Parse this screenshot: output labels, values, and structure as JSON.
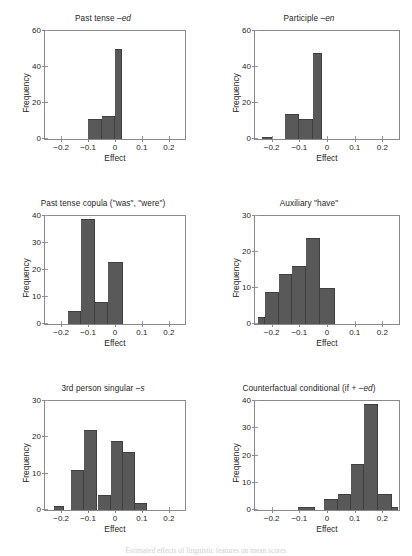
{
  "figure": {
    "background": "#ffffff",
    "bar_color": "#595959",
    "axis_color": "#8a8a8a",
    "caption": "Estimated effects of linguistic features on mean scores"
  },
  "chart_data": [
    {
      "type": "bar",
      "title_prefix": "Past tense –",
      "title_italic": "ed",
      "title": "Past tense –ed",
      "xlabel": "Effect",
      "ylabel": "Frequency",
      "xlim": [
        -0.26,
        0.26
      ],
      "ylim": [
        0,
        60
      ],
      "yticks": [
        0,
        20,
        40,
        60
      ],
      "xticks": [
        -0.2,
        -0.1,
        0,
        0.1,
        0.2
      ],
      "xticklabels": [
        "−0.2",
        "−0.1",
        "0",
        "0.1",
        "0.2"
      ],
      "grid": false,
      "bin_width": 0.05,
      "bins": [
        {
          "x0": -0.1,
          "x1": -0.05,
          "value": 11
        },
        {
          "x0": -0.05,
          "x1": 0.0,
          "value": 13
        },
        {
          "x0": 0.0,
          "x1": 0.025,
          "value": 50
        }
      ]
    },
    {
      "type": "bar",
      "title_prefix": "Participle –",
      "title_italic": "en",
      "title": "Participle –en",
      "xlabel": "Effect",
      "ylabel": "Frequency",
      "xlim": [
        -0.26,
        0.26
      ],
      "ylim": [
        0,
        60
      ],
      "yticks": [
        0,
        20,
        40,
        60
      ],
      "xticks": [
        -0.2,
        -0.1,
        0,
        0.1,
        0.2
      ],
      "xticklabels": [
        "−0.2",
        "−0.1",
        "0",
        "0.1",
        "0.2"
      ],
      "grid": false,
      "bin_width": 0.05,
      "bins": [
        {
          "x0": -0.235,
          "x1": -0.2,
          "value": 1
        },
        {
          "x0": -0.15,
          "x1": -0.1,
          "value": 14
        },
        {
          "x0": -0.1,
          "x1": -0.05,
          "value": 11
        },
        {
          "x0": -0.05,
          "x1": -0.018,
          "value": 48
        }
      ]
    },
    {
      "type": "bar",
      "title_prefix": "Past tense copula (\"was\", \"were\")",
      "title_italic": "",
      "title": "Past tense copula (\"was\", \"were\")",
      "xlabel": "Effect",
      "ylabel": "Frequency",
      "xlim": [
        -0.26,
        0.26
      ],
      "ylim": [
        0,
        40
      ],
      "yticks": [
        0,
        10,
        20,
        30,
        40
      ],
      "xticks": [
        -0.2,
        -0.1,
        0,
        0.1,
        0.2
      ],
      "xticklabels": [
        "−0.2",
        "−0.1",
        "0",
        "0.1",
        "0.2"
      ],
      "grid": false,
      "bin_width": 0.05,
      "bins": [
        {
          "x0": -0.175,
          "x1": -0.125,
          "value": 5
        },
        {
          "x0": -0.125,
          "x1": -0.075,
          "value": 39
        },
        {
          "x0": -0.075,
          "x1": -0.025,
          "value": 8
        },
        {
          "x0": -0.025,
          "x1": 0.03,
          "value": 23
        }
      ]
    },
    {
      "type": "bar",
      "title_prefix": "Auxiliary \"have\"",
      "title_italic": "",
      "title": "Auxiliary \"have\"",
      "xlabel": "Effect",
      "ylabel": "Frequency",
      "xlim": [
        -0.26,
        0.26
      ],
      "ylim": [
        0,
        30
      ],
      "yticks": [
        0,
        10,
        20,
        30
      ],
      "xticks": [
        -0.2,
        -0.1,
        0,
        0.1,
        0.2
      ],
      "xticklabels": [
        "−0.2",
        "−0.1",
        "0",
        "0.1",
        "0.2"
      ],
      "grid": false,
      "bin_width": 0.05,
      "bins": [
        {
          "x0": -0.25,
          "x1": -0.225,
          "value": 2
        },
        {
          "x0": -0.225,
          "x1": -0.175,
          "value": 9
        },
        {
          "x0": -0.175,
          "x1": -0.125,
          "value": 14
        },
        {
          "x0": -0.125,
          "x1": -0.075,
          "value": 16
        },
        {
          "x0": -0.075,
          "x1": -0.025,
          "value": 24
        },
        {
          "x0": -0.025,
          "x1": 0.03,
          "value": 10
        }
      ]
    },
    {
      "type": "bar",
      "title_prefix": "3rd person singular –",
      "title_italic": "s",
      "title": "3rd person singular –s",
      "xlabel": "Effect",
      "ylabel": "Frequency",
      "xlim": [
        -0.26,
        0.26
      ],
      "ylim": [
        0,
        30
      ],
      "yticks": [
        0,
        10,
        20,
        30
      ],
      "xticks": [
        -0.2,
        -0.1,
        0,
        0.1,
        0.2
      ],
      "xticklabels": [
        "−0.2",
        "−0.1",
        "0",
        "0.1",
        "0.2"
      ],
      "grid": false,
      "bin_width": 0.05,
      "bins": [
        {
          "x0": -0.225,
          "x1": -0.19,
          "value": 1
        },
        {
          "x0": -0.165,
          "x1": -0.115,
          "value": 11
        },
        {
          "x0": -0.115,
          "x1": -0.065,
          "value": 22
        },
        {
          "x0": -0.065,
          "x1": -0.015,
          "value": 4
        },
        {
          "x0": -0.015,
          "x1": 0.03,
          "value": 19
        },
        {
          "x0": 0.03,
          "x1": 0.075,
          "value": 16
        },
        {
          "x0": 0.075,
          "x1": 0.12,
          "value": 2
        }
      ]
    },
    {
      "type": "bar",
      "title_prefix": "Counterfactual conditional (if + –",
      "title_italic": "ed",
      "title_suffix": ")",
      "title": "Counterfactual conditional (if + –ed)",
      "xlabel": "Effect",
      "ylabel": "Frequency",
      "xlim": [
        -0.26,
        0.26
      ],
      "ylim": [
        0,
        40
      ],
      "yticks": [
        0,
        10,
        20,
        30,
        40
      ],
      "xticks": [
        -0.2,
        -0.1,
        0,
        0.1,
        0.2
      ],
      "xticklabels": [
        "−0.2",
        "−0.1",
        "0",
        "0.1",
        "0.2"
      ],
      "grid": false,
      "bin_width": 0.05,
      "bins": [
        {
          "x0": -0.105,
          "x1": -0.045,
          "value": 1
        },
        {
          "x0": -0.012,
          "x1": 0.038,
          "value": 4
        },
        {
          "x0": 0.038,
          "x1": 0.088,
          "value": 6
        },
        {
          "x0": 0.088,
          "x1": 0.135,
          "value": 17
        },
        {
          "x0": 0.135,
          "x1": 0.185,
          "value": 39
        },
        {
          "x0": 0.185,
          "x1": 0.235,
          "value": 6
        },
        {
          "x0": 0.235,
          "x1": 0.255,
          "value": 1
        }
      ]
    }
  ]
}
